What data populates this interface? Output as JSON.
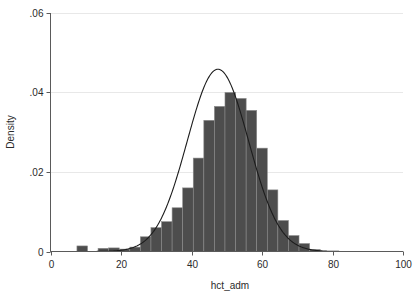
{
  "chart_data": {
    "type": "bar",
    "title": "",
    "subtitle": "",
    "xlabel": "hct_adm",
    "ylabel": "Density",
    "xlim": [
      0,
      100
    ],
    "ylim": [
      0,
      0.06
    ],
    "grid": true,
    "legend": null,
    "x_ticks": [
      0,
      20,
      40,
      60,
      80,
      100
    ],
    "x_tick_labels": [
      "0",
      "20",
      "40",
      "60",
      "80",
      "100"
    ],
    "y_ticks": [
      0,
      0.02,
      0.04,
      0.06
    ],
    "y_tick_labels": [
      "0",
      ".02",
      ".04",
      ".06"
    ],
    "bin_width": 3,
    "bar_color": "#4d4d4d",
    "bar_edge_color": "#8a8a8a",
    "curve_color": "#1c1c1c",
    "grid_color": "#e8e8e8",
    "axis_color": "#5a5a5a",
    "background_color": "#ffffff",
    "annotations": [],
    "categories": [
      "7.5-10.5",
      "10.5-13.5",
      "13.5-16.5",
      "16.5-19.5",
      "19.5-22.5",
      "22.5-25.5",
      "25.5-28.5",
      "28.5-31.5",
      "31.5-34.5",
      "34.5-37.5",
      "37.5-40.5",
      "40.5-43.5",
      "43.5-46.5",
      "46.5-49.5",
      "49.5-52.5",
      "52.5-55.5",
      "55.5-58.5",
      "58.5-61.5",
      "61.5-64.5",
      "64.5-67.5",
      "67.5-70.5",
      "70.5-73.5",
      "73.5-76.5"
    ],
    "bin_starts": [
      7.5,
      10.5,
      13.5,
      16.5,
      19.5,
      22.5,
      25.5,
      28.5,
      31.5,
      34.5,
      37.5,
      40.5,
      43.5,
      46.5,
      49.5,
      52.5,
      55.5,
      58.5,
      61.5,
      64.5,
      67.5,
      70.5,
      73.5
    ],
    "values": [
      0.0014,
      0.0,
      0.0008,
      0.0009,
      0.0006,
      0.0011,
      0.0037,
      0.006,
      0.0075,
      0.011,
      0.016,
      0.0235,
      0.033,
      0.0365,
      0.04,
      0.0385,
      0.0355,
      0.026,
      0.0155,
      0.0078,
      0.004,
      0.002,
      0.0005
    ],
    "overlay_curve": {
      "name": "normal density",
      "type": "line",
      "mean": 47.5,
      "sd": 8.7,
      "peak_value": 0.0459
    }
  },
  "axis_titles": {
    "x": "hct_adm",
    "y": "Density"
  }
}
